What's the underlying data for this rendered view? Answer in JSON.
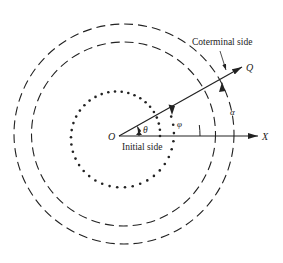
{
  "figure": {
    "type": "angle-diagram",
    "labels": {
      "origin": "O",
      "x_axis": "X",
      "terminal_point": "Q",
      "initial_side": "Initial side",
      "coterminal_side": "Coterminal side",
      "theta": "θ",
      "phi": "φ",
      "alpha": "α"
    },
    "colors": {
      "stroke": "#222222",
      "background": "#ffffff"
    },
    "elements": [
      {
        "name": "initial-side-ray",
        "description": "Ray from O along X axis"
      },
      {
        "name": "terminal-ray",
        "description": "Ray from O to Q, about 29° above X axis"
      },
      {
        "name": "theta-arc",
        "description": "Small arc with arrow showing angle θ"
      },
      {
        "name": "phi-spiral",
        "description": "Dotted spiral, one full turn plus θ, ending with arrow at OQ"
      },
      {
        "name": "inner-dashed-circle",
        "description": "Dashed circle"
      },
      {
        "name": "outer-dashed-circle",
        "description": "Dashed circle with arrow α ending on OQ"
      }
    ]
  }
}
